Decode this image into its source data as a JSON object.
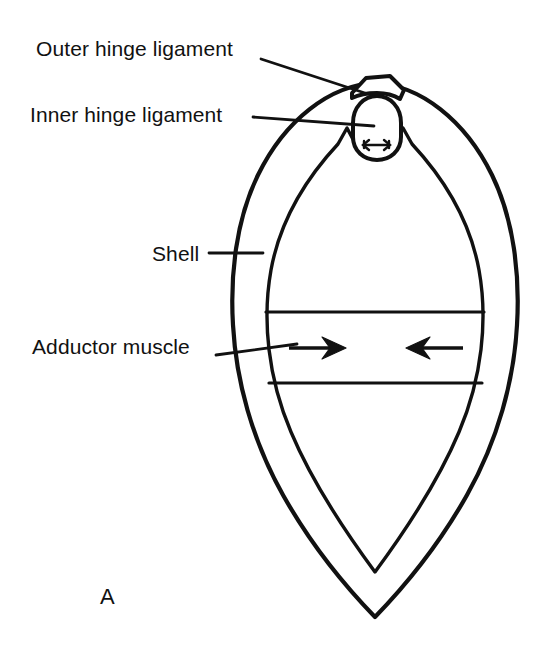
{
  "figure": {
    "panel_letter": "A",
    "background_color": "#ffffff",
    "ink_color": "#111111"
  },
  "labels": {
    "outer_hinge_ligament": "Outer hinge ligament",
    "inner_hinge_ligament": "Inner hinge ligament",
    "shell": "Shell",
    "adductor_muscle": "Adductor muscle"
  },
  "parts": {
    "outer_shell_outline": "outer-shell-outline",
    "inner_shell_outline": "inner-shell-outline",
    "hinge_cap": "outer-hinge-ligament-cap",
    "hinge_capsule": "inner-hinge-ligament-capsule",
    "adductor_band": "adductor-muscle-band"
  },
  "arrows": {
    "adductor_left": "arrow-pointing-right",
    "adductor_right": "arrow-pointing-left",
    "adductor_direction": "converging",
    "hinge_internal": "double-headed-arrow",
    "hinge_direction": "diverging"
  },
  "leaders": {
    "outer_hinge": "diagonal-leader-line",
    "inner_hinge": "horizontal-leader-line",
    "shell": "horizontal-leader-line",
    "adductor": "diagonal-leader-line"
  }
}
